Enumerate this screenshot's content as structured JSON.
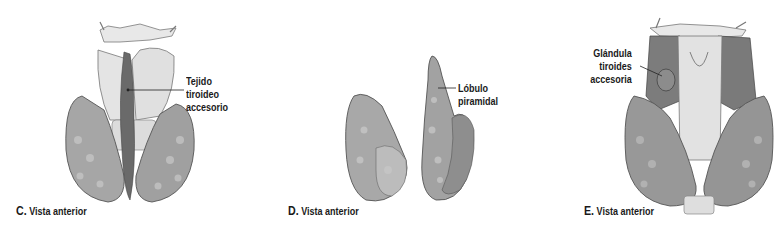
{
  "figure": {
    "panels": [
      {
        "id": "C",
        "letter": "C.",
        "caption": "Vista anterior",
        "labels": [
          {
            "line1": "Tejido",
            "line2": "tiroideo",
            "line3": "accesorio"
          }
        ]
      },
      {
        "id": "D",
        "letter": "D.",
        "caption": "Vista anterior",
        "labels": [
          {
            "line1": "Lóbulo",
            "line2": "piramidal"
          }
        ]
      },
      {
        "id": "E",
        "letter": "E.",
        "caption": "Vista anterior",
        "labels": [
          {
            "line1": "Glándula",
            "line2": "tiroides",
            "line3": "accesoria"
          }
        ]
      }
    ],
    "colors": {
      "background": "#ffffff",
      "gland_light": "#c8c8c8",
      "gland_mid": "#9a9a9a",
      "gland_dark": "#5e5e5e",
      "cartilage": "#e6e6e6",
      "text": "#1a1a1a"
    }
  }
}
